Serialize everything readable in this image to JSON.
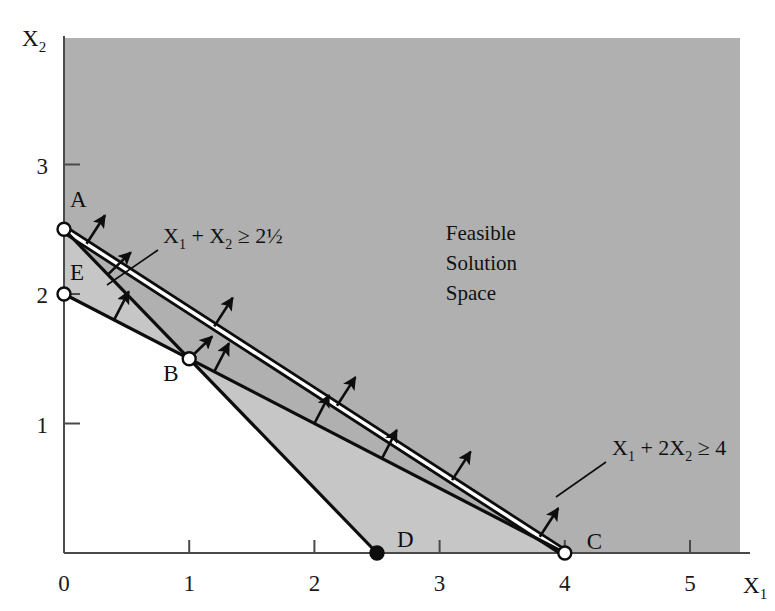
{
  "chart_data": {
    "type": "line",
    "title": "",
    "xlabel": "X1",
    "ylabel": "X2",
    "xlim": [
      0,
      5.65
    ],
    "ylim": [
      0,
      3.95
    ],
    "grid": false,
    "legend_position": "none",
    "x_ticks": [
      "0",
      "1",
      "2",
      "3",
      "4",
      "5"
    ],
    "x_tick_values": [
      0,
      1,
      2,
      3,
      4,
      5
    ],
    "y_ticks": [
      "1",
      "2",
      "3"
    ],
    "y_tick_values": [
      1,
      2,
      3
    ],
    "axis_label_x": "X",
    "axis_label_x_sub": "1",
    "axis_label_y": "X",
    "axis_label_y_sub": "2",
    "series": [
      {
        "name": "constraint-1",
        "label_main": "X",
        "label_sub1": "1",
        "label_plus": " + ",
        "label_main2": "X",
        "label_sub2": "2",
        "label_rel": " ≥ 2½",
        "equation_text": "X1 + X2 >= 2.5",
        "style": "double-line",
        "points": [
          [
            0,
            2.5
          ],
          [
            2.5,
            0
          ]
        ],
        "intercept_x": 2.5,
        "intercept_y": 2.5,
        "direction": "greater-or-equal"
      },
      {
        "name": "constraint-2",
        "label_main": "X",
        "label_sub1": "1",
        "label_plus": " + ",
        "label_main2": "2X",
        "label_sub2": "2",
        "label_rel": " ≥ 4",
        "equation_text": "X1 + 2X2 >= 4",
        "style": "single-line",
        "points": [
          [
            0,
            2
          ],
          [
            4,
            0
          ]
        ],
        "intercept_x": 4,
        "intercept_y": 2,
        "direction": "greater-or-equal"
      }
    ],
    "vertices": [
      {
        "label": "A",
        "x": 0,
        "y": 2.5,
        "marker": "open-circle"
      },
      {
        "label": "E",
        "x": 0,
        "y": 2,
        "marker": "open-circle"
      },
      {
        "label": "B",
        "x": 1,
        "y": 1.5,
        "marker": "open-circle"
      },
      {
        "label": "D",
        "x": 2.5,
        "y": 0,
        "marker": "filled-circle"
      },
      {
        "label": "C",
        "x": 4,
        "y": 0,
        "marker": "open-circle"
      }
    ],
    "annotations": [
      {
        "name": "feasible-region",
        "lines": [
          "Feasible",
          "Solution",
          "Space"
        ],
        "x": 3.05,
        "y": 2.42
      }
    ],
    "colors": {
      "feasible_fill": "#b0b0b0",
      "wedge_fill": "#c6c6c6",
      "line": "#0d0d0d",
      "line_inner": "#ffffff",
      "axis": "#4a4a4a",
      "background": "#ffffff",
      "text": "#111111"
    }
  },
  "figure": {
    "vertex_labels": [
      "A",
      "E",
      "B",
      "D",
      "C"
    ],
    "constraint_1_text": "X1 + X2 ≥ 2½",
    "constraint_2_text": "X1 + 2X2 ≥ 4",
    "region_text": "Feasible Solution Space"
  }
}
